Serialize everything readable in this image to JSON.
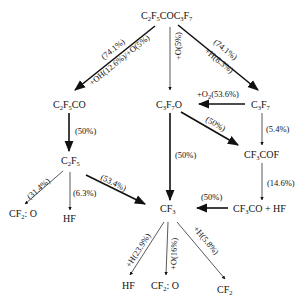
{
  "diagram": {
    "nodes": {
      "root": {
        "base": [
          "C",
          "F",
          "COC",
          "F"
        ],
        "subs": [
          "2",
          "5",
          "",
          "3",
          "7"
        ],
        "text": "C2F5COC3F7"
      },
      "c2f5co": {
        "text": "C2F5CO"
      },
      "c3f7o": {
        "text": "C3F7O"
      },
      "c3f7": {
        "text": "C3F7"
      },
      "c2f5": {
        "text": "C2F5"
      },
      "cf3cof": {
        "text": "CF3COF"
      },
      "cf3": {
        "text": "CF3"
      },
      "cf3co_hf": {
        "text": "CF3CO+HF"
      },
      "cf2o_left": {
        "text": "CF2: O"
      },
      "hf_left": {
        "text": "HF"
      },
      "hf_bottom": {
        "text": "HF"
      },
      "cf2o_bottom": {
        "text": "CF2: O"
      },
      "cf2_bottom": {
        "text": "CF2"
      }
    },
    "edges": [
      {
        "from": "C2F5COC3F7",
        "to": "C2F5CO",
        "labels": [
          "(74.1%)",
          "+OH(12.6%)/+O(5%)"
        ],
        "weight": "bold"
      },
      {
        "from": "C2F5COC3F7",
        "to": "C3F7O",
        "labels": [
          "+O(5%)"
        ],
        "weight": "thin"
      },
      {
        "from": "C2F5COC3F7",
        "to": "C3F7",
        "labels": [
          "(74.1%)",
          "+H(8.3%)"
        ],
        "weight": "bold"
      },
      {
        "from": "C3F7",
        "to": "C3F7O",
        "labels": [
          "+O2(53.6%)"
        ],
        "weight": "bold"
      },
      {
        "from": "C2F5CO",
        "to": "C2F5",
        "labels": [
          "(50%)"
        ],
        "weight": "bold"
      },
      {
        "from": "C3F7O",
        "to": "CF3COF",
        "labels": [
          "(50%)"
        ],
        "weight": "bold"
      },
      {
        "from": "C3F7",
        "to": "CF3COF",
        "labels": [
          "(5.4%)"
        ],
        "weight": "thin"
      },
      {
        "from": "C3F7O",
        "to": "CF3",
        "labels": [
          "(50%)"
        ],
        "weight": "bold"
      },
      {
        "from": "CF3COF",
        "to": "CF3CO+HF",
        "labels": [
          "(14.6%)"
        ],
        "weight": "thin"
      },
      {
        "from": "CF3CO+HF",
        "to": "CF3",
        "labels": [
          "(50%)"
        ],
        "weight": "bold"
      },
      {
        "from": "C2F5",
        "to": "CF2: O",
        "labels": [
          "(31.4%)"
        ],
        "weight": "thin"
      },
      {
        "from": "C2F5",
        "to": "HF",
        "labels": [
          "(6.3%)"
        ],
        "weight": "thin"
      },
      {
        "from": "C2F5",
        "to": "CF3",
        "labels": [
          "(53.4%)"
        ],
        "weight": "bold"
      },
      {
        "from": "CF3",
        "to": "HF",
        "labels": [
          "+H(23.9%)"
        ],
        "weight": "thin"
      },
      {
        "from": "CF3",
        "to": "CF2: O",
        "labels": [
          "+O(16%)"
        ],
        "weight": "thin"
      },
      {
        "from": "CF3",
        "to": "CF2",
        "labels": [
          "+H(5.8%)"
        ],
        "weight": "thin"
      }
    ],
    "edge_labels": {
      "e1a": "(74.1%)",
      "e1b": "+OH(12.6%)/+O(5%)",
      "e2": "+O(5%)",
      "e3a": "(74.1%)",
      "e3b": "+H(8.3%)",
      "e4_pre": "+O",
      "e4_sub": "2",
      "e4_post": "(53.6%)",
      "e5": "(50%)",
      "e6": "(50%)",
      "e7": "(5.4%)",
      "e8": "(50%)",
      "e9": "(14.6%)",
      "e10": "(50%)",
      "e11": "(31.4%)",
      "e12": "(6.3%)",
      "e13": "(53.4%)",
      "e14": "+H(23.9%)",
      "e15": "+O(16%)",
      "e16": "+H(5.8%)"
    },
    "colors": {
      "line": "#111111",
      "background": "#ffffff"
    }
  }
}
